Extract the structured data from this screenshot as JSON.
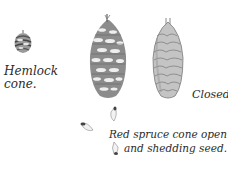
{
  "illustration": {
    "subject": "Conifer cones illustration",
    "captions": {
      "hemlock_line1": "Hemlock",
      "hemlock_line2": "cone.",
      "closed": "Closed.",
      "red_spruce_line1": "Red spruce cone open",
      "red_spruce_line2": "and shedding seed."
    },
    "figures": [
      {
        "name": "hemlock-cone",
        "description": "small rounded hemlock cone"
      },
      {
        "name": "red-spruce-cone-open",
        "description": "open red spruce cone with spreading scales"
      },
      {
        "name": "red-spruce-cone-closed",
        "description": "closed elongated red spruce cone"
      },
      {
        "name": "winged-seeds",
        "count": 3
      }
    ],
    "colors": {
      "ink": "#2b2b2b",
      "shade_dark": "#555555",
      "shade_mid": "#8a8a8a",
      "shade_light": "#c8c8c8",
      "background": "#ffffff"
    }
  }
}
